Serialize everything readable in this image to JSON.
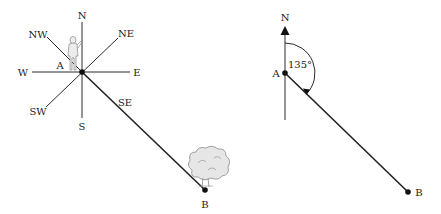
{
  "left_diagram": {
    "compass_labels": {
      "n": "N",
      "ne": "NE",
      "e": "E",
      "se": "SE",
      "s": "S",
      "sw": "SW",
      "w": "W",
      "nw": "NW"
    },
    "point_a": "A",
    "point_b": "B"
  },
  "right_diagram": {
    "north_label": "N",
    "point_a": "A",
    "point_b": "B",
    "angle_label": "135°"
  },
  "colors": {
    "line": "#2a2a2a",
    "tree_fill": "#e6e6e6",
    "figure_fill": "#ececec"
  }
}
